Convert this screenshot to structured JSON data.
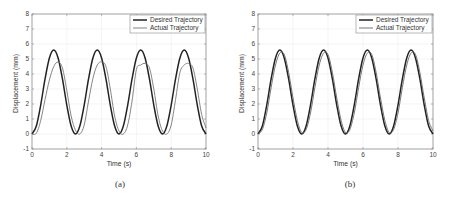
{
  "chart_data": [
    {
      "panel": "a",
      "type": "line",
      "caption": "(a)",
      "title": "",
      "xlabel": "Time (s)",
      "ylabel": "Displacement (mm)",
      "xlim": [
        0,
        10
      ],
      "ylim": [
        -1,
        8
      ],
      "xticks": [
        0,
        2,
        4,
        6,
        8,
        10
      ],
      "yticks": [
        -1,
        0,
        1,
        2,
        3,
        4,
        5,
        6,
        7,
        8
      ],
      "grid": true,
      "legend_position": "upper right",
      "x": [
        0,
        0.25,
        0.5,
        0.75,
        1,
        1.25,
        1.5,
        1.75,
        2,
        2.25,
        2.5,
        2.75,
        3,
        3.25,
        3.5,
        3.75,
        4,
        4.25,
        4.5,
        4.75,
        5,
        5.25,
        5.5,
        5.75,
        6,
        6.25,
        6.5,
        6.75,
        7,
        7.25,
        7.5,
        7.75,
        8,
        8.25,
        8.5,
        8.75,
        9,
        9.25,
        9.5,
        9.75,
        10
      ],
      "series": [
        {
          "name": "Desired Trajectory",
          "color": "#222222",
          "width": 1.5,
          "values": [
            0,
            0.53,
            1.93,
            3.67,
            5.07,
            5.6,
            5.07,
            3.67,
            1.93,
            0.53,
            0,
            0.53,
            1.93,
            3.67,
            5.07,
            5.6,
            5.07,
            3.67,
            1.93,
            0.53,
            0,
            0.53,
            1.93,
            3.67,
            5.07,
            5.6,
            5.07,
            3.67,
            1.93,
            0.53,
            0,
            0.53,
            1.93,
            3.67,
            5.07,
            5.6,
            5.07,
            3.67,
            1.93,
            0.53,
            0
          ]
        },
        {
          "name": "Actual Trajectory",
          "color": "#777777",
          "width": 0.9,
          "values": [
            0,
            0.05,
            0.9,
            2.3,
            3.6,
            4.5,
            4.8,
            4.4,
            2.9,
            1.2,
            0.25,
            0.0,
            0.6,
            2.2,
            3.7,
            4.6,
            4.8,
            4.5,
            3.0,
            1.2,
            0.2,
            0.0,
            0.6,
            2.2,
            4.3,
            4.6,
            4.7,
            4.4,
            3.0,
            1.2,
            0.2,
            0.0,
            0.6,
            2.3,
            4.1,
            4.6,
            4.7,
            4.4,
            3.0,
            1.3,
            0.4
          ]
        }
      ]
    },
    {
      "panel": "b",
      "type": "line",
      "caption": "(b)",
      "title": "",
      "xlabel": "Time (s)",
      "ylabel": "Displacement (mm)",
      "xlim": [
        0,
        10
      ],
      "ylim": [
        -1,
        8
      ],
      "xticks": [
        0,
        2,
        4,
        6,
        8,
        10
      ],
      "yticks": [
        -1,
        0,
        1,
        2,
        3,
        4,
        5,
        6,
        7,
        8
      ],
      "grid": true,
      "legend_position": "upper right",
      "x": [
        0,
        0.25,
        0.5,
        0.75,
        1,
        1.25,
        1.5,
        1.75,
        2,
        2.25,
        2.5,
        2.75,
        3,
        3.25,
        3.5,
        3.75,
        4,
        4.25,
        4.5,
        4.75,
        5,
        5.25,
        5.5,
        5.75,
        6,
        6.25,
        6.5,
        6.75,
        7,
        7.25,
        7.5,
        7.75,
        8,
        8.25,
        8.5,
        8.75,
        9,
        9.25,
        9.5,
        9.75,
        10
      ],
      "series": [
        {
          "name": "Desired Trajectory",
          "color": "#222222",
          "width": 1.5,
          "values": [
            0,
            0.53,
            1.93,
            3.67,
            5.07,
            5.6,
            5.07,
            3.67,
            1.93,
            0.53,
            0,
            0.53,
            1.93,
            3.67,
            5.07,
            5.6,
            5.07,
            3.67,
            1.93,
            0.53,
            0,
            0.53,
            1.93,
            3.67,
            5.07,
            5.6,
            5.07,
            3.67,
            1.93,
            0.53,
            0,
            0.53,
            1.93,
            3.67,
            5.07,
            5.6,
            5.07,
            3.67,
            1.93,
            0.53,
            0
          ]
        },
        {
          "name": "Actual Trajectory",
          "color": "#666666",
          "width": 0.9,
          "values": [
            0,
            0.3,
            1.4,
            3.1,
            4.6,
            5.4,
            5.3,
            4.1,
            2.4,
            0.9,
            0.1,
            0.3,
            1.4,
            3.1,
            4.6,
            5.4,
            5.3,
            4.1,
            2.4,
            0.9,
            0.1,
            0.3,
            1.4,
            3.1,
            4.6,
            5.4,
            5.3,
            4.1,
            2.4,
            0.9,
            0.1,
            0.3,
            1.4,
            3.1,
            4.6,
            5.4,
            5.3,
            4.1,
            2.4,
            0.9,
            0.2
          ]
        }
      ]
    }
  ],
  "figure": {
    "panels": [
      {
        "caption": "(a)",
        "xlabel": "Time (s)",
        "ylabel": "Displacement (mm)",
        "legend": [
          "Desired Trajectory",
          "Actual Trajectory"
        ]
      },
      {
        "caption": "(b)",
        "xlabel": "Time (s)",
        "ylabel": "Displacement (mm)",
        "legend": [
          "Desired Trajectory",
          "Actual Trajectory"
        ]
      }
    ]
  }
}
